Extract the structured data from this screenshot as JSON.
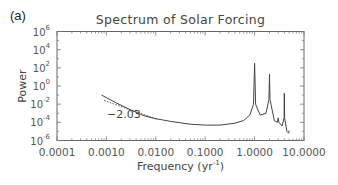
{
  "panel_label": "(a)",
  "chart_data": {
    "type": "line",
    "title": "Spectrum of Solar Forcing",
    "xlabel": "Frequency (yr⁻¹)",
    "xlabel_base": "Frequency (yr",
    "xlabel_exp": "-1",
    "xlabel_close": ")",
    "ylabel": "Power",
    "xscale": "log",
    "yscale": "log",
    "xlim": [
      0.0001,
      10.0
    ],
    "ylim": [
      1e-06,
      1000000.0
    ],
    "grid": false,
    "legend": null,
    "x_ticks": [
      "0.0001",
      "0.0010",
      "0.0100",
      "0.1000",
      "1.0000",
      "10.0000"
    ],
    "x_tick_values": [
      0.0001,
      0.001,
      0.01,
      0.1,
      1.0,
      10.0
    ],
    "y_ticks": [
      {
        "base": "10",
        "exp": "6",
        "value": 1000000.0
      },
      {
        "base": "10",
        "exp": "4",
        "value": 10000.0
      },
      {
        "base": "10",
        "exp": "2",
        "value": 100.0
      },
      {
        "base": "10",
        "exp": "0",
        "value": 1.0
      },
      {
        "base": "10",
        "exp": "-2",
        "value": 0.01
      },
      {
        "base": "10",
        "exp": "-4",
        "value": 0.0001
      },
      {
        "base": "10",
        "exp": "-6",
        "value": 1e-06
      }
    ],
    "series": [
      {
        "name": "Solar forcing spectrum",
        "style": "solid",
        "x": [
          0.0008,
          0.0015,
          0.003,
          0.006,
          0.01,
          0.02,
          0.05,
          0.1,
          0.2,
          0.4,
          0.6,
          0.8,
          0.95,
          1.0,
          1.05,
          1.3,
          1.7,
          1.95,
          2.0,
          2.05,
          2.5,
          2.9,
          3.0,
          3.1,
          3.6,
          3.95,
          4.0,
          4.05,
          4.5,
          4.9,
          5.0
        ],
        "y_log10": [
          -1.0,
          -1.8,
          -2.6,
          -3.3,
          -3.6,
          -3.9,
          -4.2,
          -4.3,
          -4.3,
          -4.1,
          -3.8,
          -3.2,
          -2.0,
          2.5,
          -2.0,
          -3.2,
          -3.0,
          -1.5,
          1.3,
          -1.5,
          -3.8,
          -4.0,
          -3.5,
          -4.0,
          -4.4,
          -3.5,
          -0.8,
          -3.5,
          -5.0,
          -5.2,
          -4.9
        ]
      },
      {
        "name": "Power-law fit",
        "style": "dotted",
        "slope_label": "−2.03",
        "slope": -2.03,
        "x": [
          0.0009,
          0.011
        ],
        "y_log10": [
          -1.6,
          -3.7
        ]
      }
    ],
    "annotations": [
      {
        "text": "−2.03",
        "x": 0.0015,
        "y_log10": -3.3
      }
    ]
  }
}
